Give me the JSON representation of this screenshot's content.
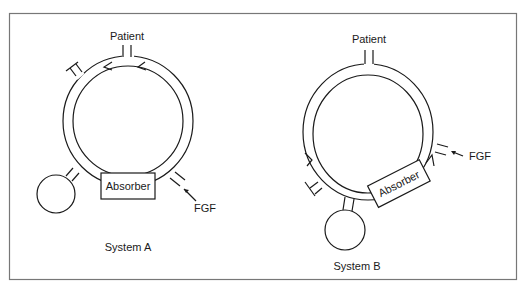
{
  "figure": {
    "border_color": "#777777",
    "line_color": "#1a1a1a"
  },
  "system_a": {
    "title": "System A",
    "patient_label": "Patient",
    "absorber_label": "Absorber",
    "fgf_label": "FGF"
  },
  "system_b": {
    "title": "System B",
    "patient_label": "Patient",
    "absorber_label": "Absorber",
    "fgf_label": "FGF"
  }
}
